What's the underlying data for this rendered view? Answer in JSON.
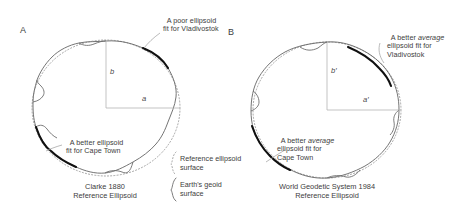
{
  "figure": {
    "panels": [
      {
        "letter": "A",
        "caption": "Clarke 1880\nReference Ellipsoid",
        "axis_major": "a",
        "axis_minor": "b",
        "callouts": [
          {
            "name": "vladivostok",
            "text_before": "A poor ellipsoid\nfit for Vladivostok",
            "emphasis": "",
            "text_after": ""
          },
          {
            "name": "capetown",
            "text_before": "A better ellipsoid\nfit for Cape Town",
            "emphasis": "",
            "text_after": ""
          }
        ]
      },
      {
        "letter": "B",
        "caption": "World Geodetic System 1984\nReference Ellipsoid",
        "axis_major": "a′",
        "axis_minor": "b′",
        "callouts": [
          {
            "name": "vladivostok",
            "text_before": "A better ",
            "emphasis": "average",
            "text_after": "\nellipsoid fit for\nVladivostok"
          },
          {
            "name": "capetown",
            "text_before": "A better ",
            "emphasis": "average",
            "text_after": "\nellipsoid fit for\nCape Town"
          }
        ]
      }
    ],
    "legend": {
      "ellipsoid": "Reference ellipsoid\nsurface",
      "geoid": "Earth's geoid\nsurface"
    },
    "colors": {
      "geoid_line": "#6d6d6d",
      "ellipsoid_line": "#9a9a9a",
      "fit_arc": "#101010",
      "axis_line": "#b4b4b4",
      "leader_line": "#a8a8a8",
      "text": "#3d3d3d"
    }
  }
}
